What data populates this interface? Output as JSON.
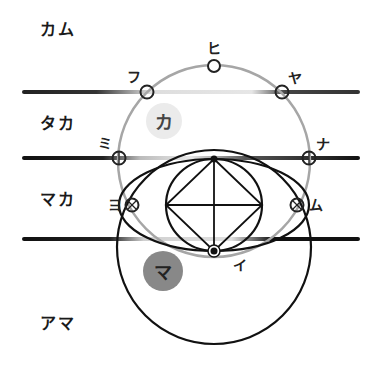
{
  "rows": [
    {
      "label": "カム"
    },
    {
      "label": "タカ"
    },
    {
      "label": "マカ"
    },
    {
      "label": "アマ"
    }
  ],
  "points": {
    "hi": "ヒ",
    "fu": "フ",
    "ya": "ヤ",
    "mi": "ミ",
    "na": "ナ",
    "yo": "ヨ",
    "mu": "ム",
    "i": "イ"
  },
  "badges": {
    "ka": {
      "label": "カ",
      "color": "#ebebeb",
      "text_color": "#444444"
    },
    "ma": {
      "label": "マ",
      "color": "#888888",
      "text_color": "#222222"
    }
  },
  "colors": {
    "line_dark": "#1a1a1a",
    "circle_gray": "#a6a6a6",
    "stroke_black": "#111111"
  }
}
